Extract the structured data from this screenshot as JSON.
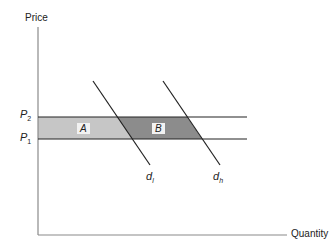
{
  "diagram": {
    "axes": {
      "y_label": "Price",
      "x_label": "Quantity"
    },
    "price_levels": [
      {
        "symbol": "P",
        "subscript": "2",
        "y": 117
      },
      {
        "symbol": "P",
        "subscript": "1",
        "y": 139
      }
    ],
    "regions": [
      {
        "label": "A",
        "fill": "#c6c6c6"
      },
      {
        "label": "B",
        "fill": "#8c8c8c"
      }
    ],
    "demand_curves": [
      {
        "symbol": "d",
        "subscript": "l"
      },
      {
        "symbol": "d",
        "subscript": "h"
      }
    ],
    "colors": {
      "axis": "#8a8a8a",
      "lines": "#222222",
      "region_a": "#c6c6c6",
      "region_b": "#8c8c8c"
    }
  }
}
